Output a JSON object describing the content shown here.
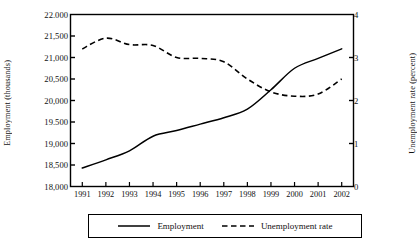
{
  "chart_data": {
    "type": "line",
    "title": "",
    "xlabel": "",
    "ylabel": "Employment (thousands)",
    "ylabel_right": "Unemployment rate (percent)",
    "grid": false,
    "legend_position": "bottom-center",
    "categories": [
      "1991",
      "1992",
      "1993",
      "1994",
      "1995",
      "1996",
      "1997",
      "1998",
      "1999",
      "2000",
      "2001",
      "2002"
    ],
    "x": [
      1991,
      1992,
      1993,
      1994,
      1995,
      1996,
      1997,
      1998,
      1999,
      2000,
      2001,
      2002
    ],
    "ylim": [
      18000,
      22000
    ],
    "yticks": [
      18000,
      18500,
      19000,
      19500,
      20000,
      20500,
      21000,
      21500,
      22000
    ],
    "ytick_labels": [
      "18,000",
      "18,500",
      "19,000",
      "19.500",
      "20,000",
      "20,500",
      "21,000",
      "21,500",
      "22.000"
    ],
    "ylim_right": [
      0,
      4
    ],
    "yticks_right": [
      0,
      1,
      2,
      3,
      4
    ],
    "ytick_labels_right": [
      "0",
      "1",
      "2",
      "3",
      "4"
    ],
    "series": [
      {
        "name": "Employment",
        "axis": "left",
        "style": "solid",
        "color": "#000000",
        "values": [
          18430,
          18620,
          18830,
          19170,
          19300,
          19450,
          19600,
          19800,
          20250,
          20750,
          20980,
          21200
        ]
      },
      {
        "name": "Unemployment rate",
        "axis": "right",
        "style": "dashed",
        "color": "#000000",
        "values": [
          3.2,
          3.45,
          3.3,
          3.28,
          3.0,
          2.98,
          2.9,
          2.5,
          2.2,
          2.1,
          2.15,
          2.5
        ]
      }
    ]
  },
  "legend": {
    "employment_label": "Employment",
    "unemployment_label": "Unemployment rate"
  }
}
